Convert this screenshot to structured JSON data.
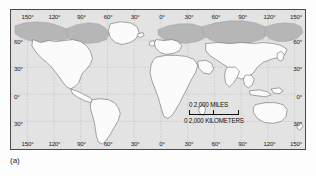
{
  "figure": {
    "caption": "(a)",
    "type": "world-map"
  },
  "map": {
    "projection_note": "cylindrical world map",
    "graticule_interval_degrees": 30,
    "ocean_color": "#e3e3e3",
    "land_color": "#fbfbfb",
    "shaded_land_color": "#b4b4b4",
    "coast_color": "#5a5a5a",
    "graticule_color": "#b0b0b0",
    "frame_color": "#4a4a4a"
  },
  "axes": {
    "longitude_top": [
      {
        "label": "150°",
        "value": -150
      },
      {
        "label": "120°",
        "value": -120
      },
      {
        "label": "90°",
        "value": -90
      },
      {
        "label": "60°",
        "value": -60
      },
      {
        "label": "30°",
        "value": -30
      },
      {
        "label": "0°",
        "value": 0
      },
      {
        "label": "30°",
        "value": 30
      },
      {
        "label": "60°",
        "value": 60
      },
      {
        "label": "90°",
        "value": 90
      },
      {
        "label": "120°",
        "value": 120
      },
      {
        "label": "150°",
        "value": 150
      }
    ],
    "longitude_bottom": [
      {
        "label": "150°",
        "value": -150
      },
      {
        "label": "120°",
        "value": -120
      },
      {
        "label": "90°",
        "value": -90
      },
      {
        "label": "60°",
        "value": -60
      },
      {
        "label": "30°",
        "value": -30
      },
      {
        "label": "0°",
        "value": 0
      },
      {
        "label": "30°",
        "value": 30
      },
      {
        "label": "60°",
        "value": 60
      },
      {
        "label": "90°",
        "value": 90
      },
      {
        "label": "120°",
        "value": 120
      },
      {
        "label": "150°",
        "value": 150
      }
    ],
    "latitude_left": [
      {
        "label": "60°",
        "value": 60
      },
      {
        "label": "30°",
        "value": 30
      },
      {
        "label": "0°",
        "value": 0
      },
      {
        "label": "30°",
        "value": -30
      }
    ],
    "latitude_right": [
      {
        "label": "60°",
        "value": 60
      },
      {
        "label": "30°",
        "value": 30
      },
      {
        "label": "0°",
        "value": 0
      },
      {
        "label": "30°",
        "value": -30
      }
    ]
  },
  "scale_bar": {
    "miles_label": "0    2,000 MILES",
    "kilometers_label": "0 2,000 KILOMETERS",
    "miles_value": 2000,
    "kilometers_value": 2000
  }
}
